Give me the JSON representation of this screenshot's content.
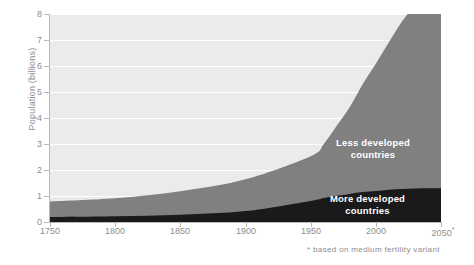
{
  "chart_data": {
    "type": "area",
    "title": "",
    "subtitle": "",
    "xlabel": "",
    "ylabel": "Population (billions)",
    "xlim": [
      1750,
      2050
    ],
    "ylim": [
      0,
      8
    ],
    "xticks": [
      1750,
      1800,
      1850,
      1900,
      1950,
      2000,
      2050
    ],
    "xticklabels": [
      "1750",
      "1800",
      "1850",
      "1900",
      "1950",
      "2000",
      "2050*"
    ],
    "yticks": [
      0,
      1,
      2,
      3,
      4,
      5,
      6,
      7,
      8
    ],
    "yticklabels": [
      "0",
      "1",
      "2",
      "3",
      "4",
      "5",
      "6",
      "7",
      "8"
    ],
    "grid": "horizontal-white",
    "stacked": true,
    "legend_position": "in-plot",
    "x": [
      1750,
      1800,
      1850,
      1900,
      1950,
      1960,
      1970,
      1980,
      1990,
      2000,
      2010,
      2020,
      2030,
      2040,
      2050
    ],
    "series": [
      {
        "name": "More developed countries",
        "color": "#1a1a1a",
        "values": [
          0.19,
          0.22,
          0.28,
          0.42,
          0.81,
          0.92,
          1.01,
          1.08,
          1.15,
          1.19,
          1.24,
          1.27,
          1.29,
          1.3,
          1.3
        ]
      },
      {
        "name": "Less developed countries",
        "color": "#808080",
        "values": [
          0.6,
          0.69,
          0.9,
          1.22,
          1.72,
          2.08,
          2.69,
          3.34,
          4.16,
          4.9,
          5.67,
          6.43,
          7.04,
          7.5,
          7.8
        ]
      }
    ],
    "totals": [
      0.79,
      0.91,
      1.18,
      1.64,
      2.53,
      3.0,
      3.7,
      4.42,
      5.31,
      6.09,
      6.91,
      7.7,
      8.33,
      8.8,
      9.1
    ],
    "annotations": [
      {
        "text": "* based on medium fertility variant",
        "position": "below-axis-right"
      }
    ]
  },
  "axes": {
    "y_title": "Population (billions)",
    "y_ticks": [
      {
        "label": "8",
        "value": 8
      },
      {
        "label": "7",
        "value": 7
      },
      {
        "label": "6",
        "value": 6
      },
      {
        "label": "5",
        "value": 5
      },
      {
        "label": "4",
        "value": 4
      },
      {
        "label": "3",
        "value": 3
      },
      {
        "label": "2",
        "value": 2
      },
      {
        "label": "1",
        "value": 1
      },
      {
        "label": "0",
        "value": 0
      }
    ],
    "x_ticks": [
      {
        "label": "1750",
        "value": 1750
      },
      {
        "label": "1800",
        "value": 1800
      },
      {
        "label": "1850",
        "value": 1850
      },
      {
        "label": "1900",
        "value": 1900
      },
      {
        "label": "1950",
        "value": 1950
      },
      {
        "label": "2000",
        "value": 2000
      },
      {
        "label": "2050",
        "value": 2050,
        "star": "*"
      }
    ]
  },
  "series_labels": {
    "less_line1": "Less developed",
    "less_line2": "countries",
    "more_line1": "More developed",
    "more_line2": "countries"
  },
  "footnote": {
    "star": "*",
    "text": "based on medium fertility variant"
  },
  "colors": {
    "plot_background": "#ebebeb",
    "gridline": "#ffffff",
    "less_developed": "#808080",
    "more_developed": "#1a1a1a",
    "axis": "#b9b9b9",
    "tick_text": "#8d8d8d",
    "label_text": "#ffffff"
  }
}
